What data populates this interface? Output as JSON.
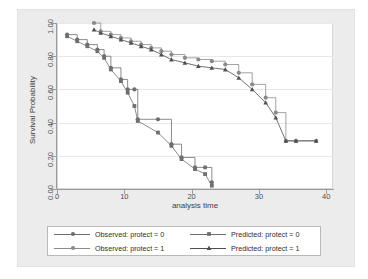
{
  "chart_data": {
    "type": "line",
    "title": "",
    "xlabel": "analysis time",
    "ylabel": "Survival Probability",
    "xlim": [
      0,
      41
    ],
    "ylim": [
      0,
      1.0
    ],
    "xticks": [
      0,
      10,
      20,
      30,
      40
    ],
    "xtick_labels": [
      "0",
      "10",
      "20",
      "30",
      "40"
    ],
    "yticks": [
      0.0,
      0.2,
      0.4,
      0.6,
      0.8,
      1.0
    ],
    "ytick_labels": [
      "0.00",
      "0.20",
      "0.40",
      "0.60",
      "0.80",
      "1.00"
    ],
    "grid": true,
    "legend_position": "below-center",
    "style": "step-and-marker Kaplan-Meier comparison",
    "series": [
      {
        "name": "Observed: protect = 0",
        "marker": "circle",
        "line": "step",
        "color": "#6f6f72",
        "x": [
          1.5,
          3.0,
          4.5,
          6.0,
          7.0,
          8.0,
          9.5,
          10.5,
          11.5,
          12.0,
          15.0,
          17.0,
          18.5,
          20.5,
          22.0,
          23.0
        ],
        "y": [
          0.93,
          0.9,
          0.87,
          0.84,
          0.8,
          0.73,
          0.66,
          0.6,
          0.6,
          0.42,
          0.42,
          0.27,
          0.19,
          0.13,
          0.13,
          0.04
        ]
      },
      {
        "name": "Predicted: protect = 0",
        "marker": "square",
        "line": "connected",
        "color": "#6f6f72",
        "x": [
          1.5,
          3.0,
          4.5,
          6.0,
          7.0,
          8.0,
          9.5,
          10.5,
          11.5,
          12.0,
          15.0,
          17.0,
          18.5,
          20.5,
          22.0,
          23.0
        ],
        "y": [
          0.92,
          0.89,
          0.86,
          0.83,
          0.79,
          0.72,
          0.65,
          0.58,
          0.5,
          0.41,
          0.34,
          0.26,
          0.18,
          0.12,
          0.09,
          0.02
        ]
      },
      {
        "name": "Observed: protect = 1",
        "marker": "circle",
        "line": "step",
        "color": "#8a8a8d",
        "x": [
          5.5,
          6.5,
          8.0,
          9.5,
          11.0,
          12.5,
          14.0,
          15.5,
          17.0,
          19.0,
          21.0,
          23.0,
          25.0,
          27.0,
          29.0,
          31.0,
          32.5,
          34.0,
          35.5,
          38.5
        ],
        "y": [
          1.0,
          0.95,
          0.93,
          0.91,
          0.89,
          0.87,
          0.85,
          0.83,
          0.81,
          0.79,
          0.78,
          0.77,
          0.75,
          0.7,
          0.63,
          0.55,
          0.46,
          0.29,
          0.29,
          0.29
        ]
      },
      {
        "name": "Predicted: protect = 1",
        "marker": "triangle",
        "line": "connected",
        "color": "#4f4f52",
        "x": [
          5.5,
          6.5,
          8.0,
          9.5,
          11.0,
          12.5,
          14.0,
          15.5,
          17.0,
          19.0,
          21.0,
          23.0,
          25.0,
          27.0,
          29.0,
          31.0,
          32.5,
          34.0,
          35.5,
          38.5
        ],
        "y": [
          0.96,
          0.94,
          0.92,
          0.9,
          0.88,
          0.86,
          0.84,
          0.81,
          0.78,
          0.76,
          0.74,
          0.73,
          0.72,
          0.67,
          0.6,
          0.52,
          0.43,
          0.29,
          0.29,
          0.29
        ]
      }
    ]
  },
  "axes": {
    "y_title": "Survival Probability",
    "x_title": "analysis time"
  },
  "legend": {
    "entries": [
      {
        "label": "Observed: protect = 0",
        "marker": "circle-marker"
      },
      {
        "label": "Observed: protect = 1",
        "marker": "circle-marker"
      },
      {
        "label": "Predicted: protect = 0",
        "marker": "square-marker"
      },
      {
        "label": "Predicted: protect = 1",
        "marker": "triangle-marker"
      }
    ]
  },
  "colors": {
    "plot_background": "#ffffff",
    "frame_background": "#ececed",
    "axis": "#9a9a9c",
    "grid": "#e8e8e9",
    "series_dark": "#4f4f52",
    "series_mid": "#6f6f72",
    "series_light": "#8a8a8d"
  }
}
